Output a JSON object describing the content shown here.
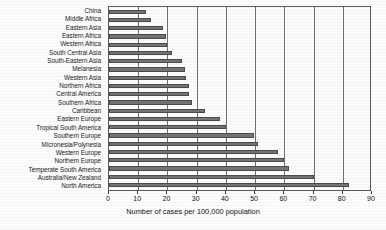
{
  "chart_data": {
    "type": "bar",
    "orientation": "horizontal",
    "title": "",
    "xlabel": "Number of cases per 100,000 population",
    "ylabel": "",
    "xlim": [
      0,
      90
    ],
    "xticks": [
      0,
      10,
      20,
      30,
      40,
      50,
      60,
      70,
      80,
      90
    ],
    "grid": "vertical",
    "legend": "none",
    "bar_color": "#737373",
    "categories": [
      "China",
      "Middle Africa",
      "Eastern Asia",
      "Eastern Africa",
      "Western Africa",
      "South Central Asia",
      "South-Eastern Asia",
      "Melanesia",
      "Western Asia",
      "Northern Africa",
      "Central America",
      "Southern Africa",
      "Caribbean",
      "Eastern Europe",
      "Tropical South America",
      "Southern Europe",
      "Micronesia/Polynesia",
      "Western Europe",
      "Northern Europe",
      "Temperate South America",
      "Australia/New Zealand",
      "North America"
    ],
    "values": [
      12.5,
      14.5,
      18.5,
      19.5,
      20.0,
      21.5,
      25.0,
      26.0,
      26.5,
      27.5,
      27.5,
      28.5,
      33.0,
      38.0,
      40.0,
      49.5,
      51.0,
      58.0,
      60.0,
      61.5,
      70.0,
      82.0
    ]
  }
}
